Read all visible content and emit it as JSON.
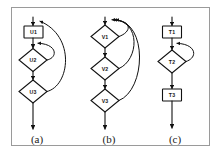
{
  "figure": {
    "caption_style": "lettered",
    "background_color": "#ffffff",
    "border_color": "#9a9a9a",
    "stroke_color": "#111111",
    "panels": [
      {
        "id": "panel-a",
        "caption": "(a)",
        "nodes": [
          {
            "id": "u1",
            "label": "U1",
            "shape": "rectangle"
          },
          {
            "id": "u2",
            "label": "U2",
            "shape": "diamond"
          },
          {
            "id": "u3",
            "label": "U3",
            "shape": "diamond"
          }
        ],
        "edges": [
          {
            "from": "entry",
            "to": "u1",
            "kind": "forward"
          },
          {
            "from": "u1",
            "to": "u2",
            "kind": "forward"
          },
          {
            "from": "u2",
            "to": "u3",
            "kind": "forward"
          },
          {
            "from": "u3",
            "to": "exit",
            "kind": "forward"
          },
          {
            "from": "u2",
            "to": "u2-top",
            "kind": "back-loop"
          },
          {
            "from": "u3",
            "to": "u1-top",
            "kind": "back-loop"
          }
        ]
      },
      {
        "id": "panel-b",
        "caption": "(b)",
        "nodes": [
          {
            "id": "v1",
            "label": "V1",
            "shape": "diamond"
          },
          {
            "id": "v2",
            "label": "V2",
            "shape": "diamond"
          },
          {
            "id": "v3",
            "label": "V3",
            "shape": "diamond"
          }
        ],
        "edges": [
          {
            "from": "entry",
            "to": "v1",
            "kind": "forward"
          },
          {
            "from": "v1",
            "to": "v2",
            "kind": "forward"
          },
          {
            "from": "v2",
            "to": "v3",
            "kind": "forward"
          },
          {
            "from": "v3",
            "to": "exit",
            "kind": "forward"
          },
          {
            "from": "v1",
            "to": "v1-top",
            "kind": "back-loop"
          },
          {
            "from": "v2",
            "to": "v1-top",
            "kind": "back-loop"
          },
          {
            "from": "v3",
            "to": "v1-top",
            "kind": "back-loop"
          }
        ]
      },
      {
        "id": "panel-c",
        "caption": "(c)",
        "nodes": [
          {
            "id": "t1",
            "label": "T1",
            "shape": "rectangle"
          },
          {
            "id": "t2",
            "label": "T2",
            "shape": "diamond"
          },
          {
            "id": "t3",
            "label": "T3",
            "shape": "rectangle"
          }
        ],
        "edges": [
          {
            "from": "entry",
            "to": "t1",
            "kind": "forward"
          },
          {
            "from": "t1",
            "to": "t2",
            "kind": "forward"
          },
          {
            "from": "t2",
            "to": "t3",
            "kind": "forward"
          },
          {
            "from": "t3",
            "to": "exit",
            "kind": "forward"
          },
          {
            "from": "t2",
            "to": "t2-top",
            "kind": "back-loop"
          }
        ]
      }
    ]
  }
}
